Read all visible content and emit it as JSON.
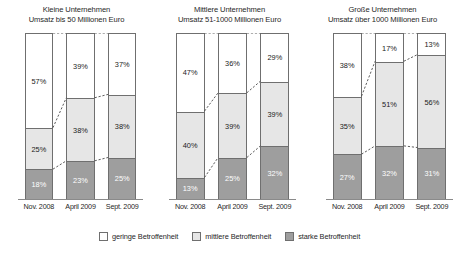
{
  "chart_data": {
    "type": "bar",
    "subtype": "100% stacked column",
    "title": "",
    "xlabel": "",
    "ylabel": "",
    "ylim": [
      0,
      100
    ],
    "grid": false,
    "legend_position": "bottom",
    "categories": [
      "Nov. 2008",
      "April 2009",
      "Sept. 2009"
    ],
    "series": [
      {
        "name": "geringe Betroffenheit",
        "color": "#ffffff"
      },
      {
        "name": "mittlere Betroffenheit",
        "color": "#e6e6e6"
      },
      {
        "name": "starke Betroffenheit",
        "color": "#9e9e9e"
      }
    ],
    "panels": [
      {
        "title_line1": "Kleine Unternehmen",
        "title_line2": "Umsatz bis 50 Millionen Euro",
        "bars": [
          {
            "category": "Nov. 2008",
            "low": 57,
            "mid": 25,
            "high": 18,
            "low_label": "57%",
            "mid_label": "25%",
            "high_label": "18%"
          },
          {
            "category": "April 2009",
            "low": 39,
            "mid": 38,
            "high": 23,
            "low_label": "39%",
            "mid_label": "38%",
            "high_label": "23%"
          },
          {
            "category": "Sept. 2009",
            "low": 37,
            "mid": 38,
            "high": 25,
            "low_label": "37%",
            "mid_label": "38%",
            "high_label": "25%"
          }
        ]
      },
      {
        "title_line1": "Mittlere Unternehmen",
        "title_line2": "Umsatz 51-1000 Millionen Euro",
        "bars": [
          {
            "category": "Nov. 2008",
            "low": 47,
            "mid": 40,
            "high": 13,
            "low_label": "47%",
            "mid_label": "40%",
            "high_label": "13%"
          },
          {
            "category": "April 2009",
            "low": 36,
            "mid": 39,
            "high": 25,
            "low_label": "36%",
            "mid_label": "39%",
            "high_label": "25%"
          },
          {
            "category": "Sept. 2009",
            "low": 29,
            "mid": 39,
            "high": 32,
            "low_label": "29%",
            "mid_label": "39%",
            "high_label": "32%"
          }
        ]
      },
      {
        "title_line1": "Große Unternehmen",
        "title_line2": "Umsatz über 1000 Millionen Euro",
        "bars": [
          {
            "category": "Nov. 2008",
            "low": 38,
            "mid": 35,
            "high": 27,
            "low_label": "38%",
            "mid_label": "35%",
            "high_label": "27%"
          },
          {
            "category": "April 2009",
            "low": 17,
            "mid": 51,
            "high": 32,
            "low_label": "17%",
            "mid_label": "51%",
            "high_label": "32%"
          },
          {
            "category": "Sept. 2009",
            "low": 13,
            "mid": 56,
            "high": 31,
            "low_label": "13%",
            "mid_label": "56%",
            "high_label": "31%"
          }
        ]
      }
    ]
  },
  "legend": {
    "items": [
      {
        "label": "geringe Betroffenheit",
        "swatch": "low"
      },
      {
        "label": "mittlere Betroffenheit",
        "swatch": "mid"
      },
      {
        "label": "starke Betroffenheit",
        "swatch": "high"
      }
    ]
  }
}
